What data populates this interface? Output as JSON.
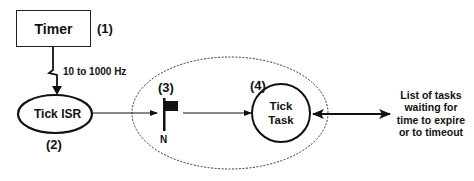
{
  "diagram": {
    "timer": {
      "label": "Timer",
      "number": "(1)"
    },
    "frequency_label": "10 to 1000 Hz",
    "tick_isr": {
      "label": "Tick ISR",
      "number": "(2)"
    },
    "semaphore": {
      "number": "(3)",
      "count_label": "N"
    },
    "tick_task": {
      "line1": "Tick",
      "line2": "Task",
      "number": "(4)"
    },
    "task_list": {
      "line1": "List of tasks",
      "line2": "waiting for",
      "line3": "time to expire",
      "line4": "or to timeout"
    },
    "colors": {
      "stroke": "#111111",
      "background": "#ffffff"
    }
  }
}
